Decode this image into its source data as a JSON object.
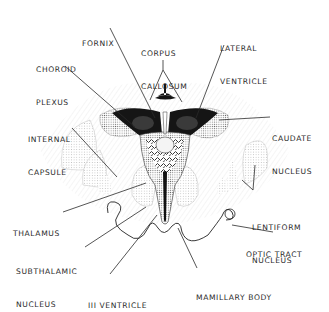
{
  "diagram": {
    "colors": {
      "ink": "#1a1a1a",
      "stipple": "#9a9a9a",
      "light_stipple": "#d4d4d4",
      "background": "#ffffff"
    },
    "labels": {
      "fornix": {
        "lines": [
          "FORNIX"
        ]
      },
      "corpus_callosum": {
        "lines": [
          "CORPUS",
          "CALLOSUM"
        ]
      },
      "lateral_ventricle": {
        "lines": [
          "LATERAL",
          "VENTRICLE"
        ]
      },
      "choroid_plexus": {
        "lines": [
          "CHOROID",
          "PLEXUS"
        ]
      },
      "internal_capsule": {
        "lines": [
          "INTERNAL",
          "CAPSULE"
        ]
      },
      "caudate_nucleus": {
        "lines": [
          "CAUDATE",
          "NUCLEUS"
        ]
      },
      "thalamus": {
        "lines": [
          "THALAMUS"
        ]
      },
      "lentiform_nucleus": {
        "lines": [
          "LENTIFORM",
          "NUCLEUS"
        ]
      },
      "subthalamic_nucleus": {
        "lines": [
          "SUBTHALAMIC",
          "NUCLEUS"
        ]
      },
      "optic_tract": {
        "lines": [
          "OPTIC TRACT"
        ]
      },
      "third_ventricle": {
        "lines": [
          "III VENTRICLE"
        ]
      },
      "mamillary_body": {
        "lines": [
          "MAMILLARY BODY"
        ]
      }
    }
  }
}
